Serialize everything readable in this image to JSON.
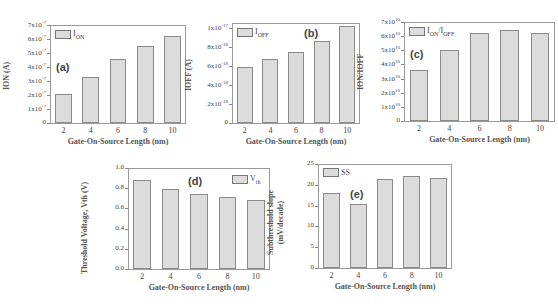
{
  "chart_data": [
    {
      "id": "a",
      "type": "bar",
      "panel_label": "(a)",
      "legend": "I_ON",
      "legend_text": "ION",
      "categories": [
        "2",
        "4",
        "6",
        "8",
        "10"
      ],
      "values": [
        2.1e-07,
        3.3e-07,
        4.55e-07,
        5.5e-07,
        6.2e-07
      ],
      "xlabel": "Gate-On-Source Length (nm)",
      "ylabel": "ION (A)",
      "ylim": [
        0,
        7e-07
      ],
      "yticks": [
        "0",
        "1x10-7",
        "2x10-7",
        "3x10-7",
        "4x10-7",
        "5x10-7",
        "6x10-7",
        "7x10-7"
      ],
      "ytick_values": [
        0,
        1e-07,
        2e-07,
        3e-07,
        4e-07,
        5e-07,
        6e-07,
        7e-07
      ],
      "legend_position": "upper left"
    },
    {
      "id": "b",
      "type": "bar",
      "panel_label": "(b)",
      "legend": "I_OFF",
      "legend_text": "IOFF",
      "categories": [
        "2",
        "4",
        "6",
        "8",
        "10"
      ],
      "values": [
        5.9e-18,
        6.7e-18,
        7.5e-18,
        8.6e-18,
        1.02e-17
      ],
      "xlabel": "Gate-On-Source Length (nm)",
      "ylabel": "IOFF (A)",
      "ylim": [
        0,
        1.05e-17
      ],
      "yticks": [
        "0",
        "2x10-18",
        "4x10-18",
        "6x10-18",
        "8x10-18",
        "1x10-17"
      ],
      "ytick_values": [
        0,
        2e-18,
        4e-18,
        6e-18,
        8e-18,
        1e-17
      ],
      "legend_position": "upper left"
    },
    {
      "id": "c",
      "type": "bar",
      "panel_label": "(c)",
      "legend": "I_ON/I_OFF",
      "legend_text": "ION/IOFF",
      "categories": [
        "2",
        "4",
        "6",
        "8",
        "10"
      ],
      "values": [
        36000000000.0,
        50000000000.0,
        62000000000.0,
        64000000000.0,
        62000000000.0
      ],
      "xlabel": "Gate-On-Source Length (nm)",
      "ylabel": "ION/IOFF",
      "ylim": [
        0,
        70000000000.0
      ],
      "yticks": [
        "0",
        "1x10^10",
        "2x10^10",
        "3x10^10",
        "4x10^10",
        "5x10^10",
        "6x10^10",
        "7x10^10"
      ],
      "ytick_values": [
        0,
        10000000000.0,
        20000000000.0,
        30000000000.0,
        40000000000.0,
        50000000000.0,
        60000000000.0,
        70000000000.0
      ],
      "legend_position": "upper left"
    },
    {
      "id": "d",
      "type": "bar",
      "panel_label": "(d)",
      "legend": "V_th",
      "legend_text": "Vth",
      "categories": [
        "2",
        "4",
        "6",
        "8",
        "10"
      ],
      "values": [
        0.88,
        0.79,
        0.74,
        0.71,
        0.68
      ],
      "xlabel": "Gate-On-Source Length (nm)",
      "ylabel": "Threshold Voltage, Vth (V)",
      "ylim": [
        0,
        1.0
      ],
      "yticks": [
        "0.0",
        "0.2",
        "0.4",
        "0.6",
        "0.8",
        "1.0"
      ],
      "ytick_values": [
        0,
        0.2,
        0.4,
        0.6,
        0.8,
        1.0
      ],
      "legend_position": "upper right"
    },
    {
      "id": "e",
      "type": "bar",
      "panel_label": "(e)",
      "legend": "SS",
      "legend_text": "SS",
      "categories": [
        "2",
        "4",
        "6",
        "8",
        "10"
      ],
      "values": [
        18.0,
        15.3,
        21.3,
        22.0,
        21.7
      ],
      "xlabel": "Gate-On-Source Length (nm)",
      "ylabel": "Subthreshold slope (mV/decade)",
      "ylabel_lines": [
        "Subthreshold slope",
        "(mV/decade)"
      ],
      "ylim": [
        0,
        25
      ],
      "yticks": [
        "0",
        "5",
        "10",
        "15",
        "20",
        "25"
      ],
      "ytick_values": [
        0,
        5,
        10,
        15,
        20,
        25
      ],
      "legend_position": "upper left"
    }
  ],
  "layout": {
    "bar_fill": "#dcdcdc",
    "bar_edge": "#8a8a8a",
    "frame_color": "#9a9a9a",
    "panels": {
      "a": {
        "x0": 50,
        "x1": 186,
        "ytop": 25,
        "ybot": 123
      },
      "b": {
        "x0": 232,
        "x1": 360,
        "ytop": 23,
        "ybot": 123
      },
      "c": {
        "x0": 404,
        "x1": 555,
        "ytop": 22,
        "ybot": 121
      },
      "d": {
        "x0": 128,
        "x1": 270,
        "ytop": 168,
        "ybot": 269
      },
      "e": {
        "x0": 318,
        "x1": 452,
        "ytop": 164,
        "ybot": 268
      }
    }
  }
}
